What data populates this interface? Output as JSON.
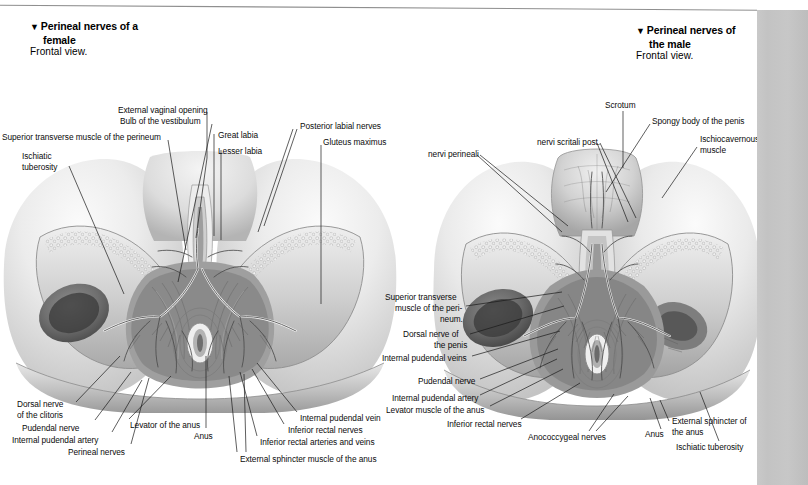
{
  "page": {
    "background": "#ffffff",
    "scan_edge_color": "#c5c5c5",
    "rule_color": "#8c8c8c"
  },
  "figures": [
    {
      "id": "female",
      "marker": "▼",
      "title_line1": "Perineal nerves of a",
      "title_line2": "female",
      "subtitle": "Frontal view.",
      "labels": [
        {
          "name": "external-vaginal-opening",
          "text": "External vaginal opening",
          "x": 118,
          "y": 106,
          "align": "left",
          "line": [
            [
              207,
              112
            ],
            [
              196,
              235
            ]
          ]
        },
        {
          "name": "bulb-of-the-vestibulum",
          "text": "Bulb of the vestibulum",
          "x": 120,
          "y": 117,
          "align": "left",
          "line": [
            [
              212,
              123
            ],
            [
              175,
              277
            ]
          ]
        },
        {
          "name": "superior-transverse-muscle-of-the-perineum",
          "text": "Superior transverse muscle of the perineum",
          "x": 2,
          "y": 133,
          "align": "left",
          "line": [
            [
              168,
              139
            ],
            [
              183,
              245
            ]
          ]
        },
        {
          "name": "great-labia",
          "text": "Great labia",
          "x": 218,
          "y": 131,
          "align": "left",
          "line": [
            [
              214,
              131
            ],
            [
              214,
              232
            ]
          ]
        },
        {
          "name": "lesser-labia",
          "text": "Lesser labia",
          "x": 218,
          "y": 147,
          "align": "left",
          "line": [
            [
              214,
              147
            ],
            [
              214,
              232
            ]
          ]
        },
        {
          "name": "posterior-labial-nerves",
          "text": "Posterior labial nerves",
          "x": 300,
          "y": 122,
          "align": "left",
          "line": [
            [
              298,
              128
            ],
            [
              262,
              222
            ]
          ]
        },
        {
          "name": "gluteus-maximus",
          "text": "Gluteus maximus",
          "x": 323,
          "y": 138,
          "align": "left",
          "line": [
            [
              320,
              143
            ],
            [
              320,
              300
            ]
          ]
        },
        {
          "name": "ischiatic-tuberosity-1",
          "text": "Ischiatic",
          "x": 22,
          "y": 152,
          "align": "left",
          "line": [
            [
              70,
              165
            ],
            [
              122,
              290
            ]
          ]
        },
        {
          "name": "ischiatic-tuberosity-2",
          "text": "tuberosity",
          "x": 22,
          "y": 163,
          "align": "left",
          "line": null
        },
        {
          "name": "dorsal-nerve-of-the-clitoris-1",
          "text": "Dorsal nerve",
          "x": 17,
          "y": 400,
          "align": "left",
          "line": [
            [
              76,
              403
            ],
            [
              118,
              355
            ]
          ]
        },
        {
          "name": "dorsal-nerve-of-the-clitoris-2",
          "text": "of the clitoris",
          "x": 17,
          "y": 411,
          "align": "left",
          "line": null
        },
        {
          "name": "pudendal-nerve",
          "text": "Pudendal nerve",
          "x": 22,
          "y": 424,
          "align": "left",
          "line": [
            [
              92,
              422
            ],
            [
              128,
              372
            ]
          ]
        },
        {
          "name": "internal-pudendal-artery",
          "text": "Internal pudendal artery",
          "x": 12,
          "y": 436,
          "align": "left",
          "line": [
            [
              110,
              434
            ],
            [
              140,
              380
            ]
          ]
        },
        {
          "name": "perineal-nerves",
          "text": "Perineal nerves",
          "x": 68,
          "y": 448,
          "align": "left",
          "line": [
            [
              128,
              446
            ],
            [
              146,
              378
            ]
          ]
        },
        {
          "name": "levator-of-the-anus",
          "text": "Levator of the anus",
          "x": 130,
          "y": 421,
          "align": "left",
          "line": [
            [
              128,
              421
            ],
            [
              170,
              376
            ]
          ]
        },
        {
          "name": "anus",
          "text": "Anus",
          "x": 194,
          "y": 432,
          "align": "left",
          "line": [
            [
              205,
              430
            ],
            [
              205,
              355
            ]
          ]
        },
        {
          "name": "internal-pudendal-vein",
          "text": "Internal pudendal vein",
          "x": 300,
          "y": 414,
          "align": "left",
          "line": [
            [
              297,
              414
            ],
            [
              255,
              362
            ]
          ]
        },
        {
          "name": "inferior-rectal-nerves",
          "text": "Inferior rectal nerves",
          "x": 288,
          "y": 426,
          "align": "left",
          "line": [
            [
              285,
              426
            ],
            [
              250,
              368
            ]
          ]
        },
        {
          "name": "inferior-rectal-arteries-and-veins",
          "text": "Inferior rectal arteries and veins",
          "x": 260,
          "y": 438,
          "align": "left",
          "line": [
            [
              258,
              438
            ],
            [
              238,
              372
            ]
          ]
        },
        {
          "name": "external-sphincter-muscle-of-the-anus",
          "text": "External sphincter muscle of the anus",
          "x": 240,
          "y": 455,
          "align": "left",
          "line": [
            [
              238,
              454
            ],
            [
              228,
              376
            ]
          ]
        }
      ]
    },
    {
      "id": "male",
      "marker": "▼",
      "title_line1": "Perineal nerves of",
      "title_line2": "the male",
      "subtitle": "Frontal view.",
      "labels": [
        {
          "name": "scrotum",
          "text": "Scrotum",
          "x": 605,
          "y": 101,
          "align": "left",
          "line": [
            [
              622,
              110
            ],
            [
              622,
              165
            ]
          ]
        },
        {
          "name": "spongy-body-of-the-penis",
          "text": "Spongy body of the penis",
          "x": 652,
          "y": 117,
          "align": "left",
          "line": [
            [
              650,
              123
            ],
            [
              608,
              190
            ]
          ]
        },
        {
          "name": "ischiocavernous-muscle-1",
          "text": "Ischiocavernous",
          "x": 700,
          "y": 135,
          "align": "left",
          "line": [
            [
              698,
              145
            ],
            [
              663,
              196
            ]
          ]
        },
        {
          "name": "ischiocavernous-muscle-2",
          "text": "muscle",
          "x": 700,
          "y": 146,
          "align": "left",
          "line": null
        },
        {
          "name": "nervi-scritali-post",
          "text": "nervi scritali post.",
          "x": 537,
          "y": 138,
          "align": "left",
          "line": [
            [
              598,
              142
            ],
            [
              628,
              218
            ]
          ]
        },
        {
          "name": "nervi-perineali",
          "text": "nervi perineali",
          "x": 428,
          "y": 150,
          "align": "left",
          "line": [
            [
              478,
              154
            ],
            [
              560,
              230
            ]
          ]
        },
        {
          "name": "superior-transverse-1",
          "text": "Superior transverse",
          "x": 385,
          "y": 293,
          "align": "left",
          "line": [
            [
              466,
              305
            ],
            [
              560,
              290
            ]
          ]
        },
        {
          "name": "superior-transverse-2",
          "text": "muscle of the peri-",
          "x": 395,
          "y": 304,
          "align": "left",
          "line": null
        },
        {
          "name": "superior-transverse-3",
          "text": "neum.",
          "x": 440,
          "y": 315,
          "align": "left",
          "line": null
        },
        {
          "name": "dorsal-nerve-of-the-penis-1",
          "text": "Dorsal nerve of",
          "x": 403,
          "y": 330,
          "align": "left",
          "line": [
            [
              468,
              333
            ],
            [
              562,
              305
            ]
          ]
        },
        {
          "name": "dorsal-nerve-of-the-penis-2",
          "text": "the penis",
          "x": 434,
          "y": 341,
          "align": "left",
          "line": null
        },
        {
          "name": "internal-pudendal-veins",
          "text": "Internal pudendal veins",
          "x": 382,
          "y": 354,
          "align": "left",
          "line": [
            [
              470,
              356
            ],
            [
              558,
              330
            ]
          ]
        },
        {
          "name": "pudendal-nerve-m",
          "text": "Pudendal nerve",
          "x": 418,
          "y": 377,
          "align": "left",
          "line": [
            [
              478,
              378
            ],
            [
              556,
              348
            ]
          ]
        },
        {
          "name": "internal-pudendal-artery-m",
          "text": "Internal pudendal artery",
          "x": 392,
          "y": 394,
          "align": "left",
          "line": [
            [
              478,
              394
            ],
            [
              556,
              358
            ]
          ]
        },
        {
          "name": "levator-muscle-of-the-anus",
          "text": "Levator muscle of the anus",
          "x": 386,
          "y": 406,
          "align": "left",
          "line": [
            [
              488,
              405
            ],
            [
              562,
              368
            ]
          ]
        },
        {
          "name": "inferior-rectal-nerves-m",
          "text": "Inferior rectal nerves",
          "x": 447,
          "y": 420,
          "align": "left",
          "line": [
            [
              522,
              418
            ],
            [
              580,
              382
            ]
          ]
        },
        {
          "name": "anococcygeal-nerves",
          "text": "Anococcygeal nerves",
          "x": 528,
          "y": 433,
          "align": "left",
          "line": [
            [
              590,
              430
            ],
            [
              616,
              392
            ]
          ]
        },
        {
          "name": "anus-m",
          "text": "Anus",
          "x": 645,
          "y": 430,
          "align": "left",
          "line": [
            [
              660,
              428
            ],
            [
              648,
              396
            ]
          ]
        },
        {
          "name": "external-sphincter-of-1",
          "text": "External sphincter of",
          "x": 672,
          "y": 417,
          "align": "left",
          "line": [
            [
              670,
              420
            ],
            [
              660,
              398
            ]
          ]
        },
        {
          "name": "external-sphincter-of-2",
          "text": "the anus",
          "x": 672,
          "y": 428,
          "align": "left",
          "line": null
        },
        {
          "name": "ischiatic-tuberosity-m",
          "text": "Ischiatic tuberosity",
          "x": 676,
          "y": 443,
          "align": "left",
          "line": [
            [
              720,
              440
            ],
            [
              700,
              390
            ]
          ]
        }
      ]
    }
  ]
}
